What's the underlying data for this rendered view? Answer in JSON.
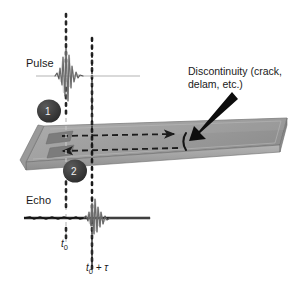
{
  "figure": {
    "width": 302,
    "height": 284,
    "background_color": "#ffffff"
  },
  "labels": {
    "pulse": "Pulse",
    "echo": "Echo",
    "discontinuity": "Discontinuity (crack, delam, etc.)",
    "discontinuity_line1": "Discontinuity (crack,",
    "discontinuity_line2": "delam, etc.)",
    "time_origin": "t",
    "time_origin_sub": "0",
    "time_echo_lead": "t",
    "time_echo_sub": "0",
    "time_echo_tail": " + ",
    "time_echo_tau": "τ"
  },
  "badges": [
    {
      "id": "1",
      "label": "1",
      "role": "transmit-step"
    },
    {
      "id": "2",
      "label": "2",
      "role": "receive-step"
    }
  ],
  "colors": {
    "plate_top": "#9d9d9d",
    "plate_side": "#8a8a8a",
    "plate_edge": "#b9b9b9",
    "plate_outline": "#6f6f6f",
    "transducer_patch": "#7c7c7c",
    "badge_fill": "#3a3a3a",
    "badge_text": "#f2f2f2",
    "arrow_dashed": "#1c1c1c",
    "pointer_arrow": "#0d0d0d",
    "crack": "#141414",
    "timeline_t0": "#c0c0c0",
    "timeline_t0tau": "#1a1a1a",
    "waveform": "#4a4a4a",
    "baseline_pulse": "#b3b3b3",
    "baseline_echo": "#2b2b2b",
    "text": "#1a1a1a"
  },
  "geometry": {
    "timeline_t0_x": 66,
    "timeline_t0tau_x": 92,
    "pulse_baseline_y": 76,
    "echo_baseline_y": 218,
    "plate_top_y": 120,
    "plate_bottom_y": 168
  }
}
